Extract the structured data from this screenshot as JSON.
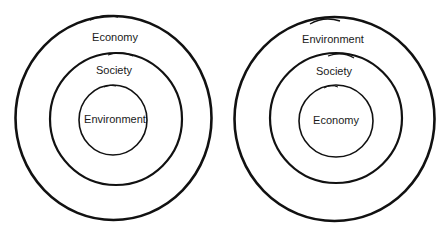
{
  "diagrams": [
    {
      "name": "Nested model A",
      "rings": [
        {
          "label": "Economy"
        },
        {
          "label": "Society"
        },
        {
          "label": "Environment"
        }
      ]
    },
    {
      "name": "Nested model B",
      "rings": [
        {
          "label": "Environment"
        },
        {
          "label": "Society"
        },
        {
          "label": "Economy"
        }
      ]
    }
  ],
  "colors": {
    "stroke": "#111111",
    "background": "#ffffff"
  }
}
